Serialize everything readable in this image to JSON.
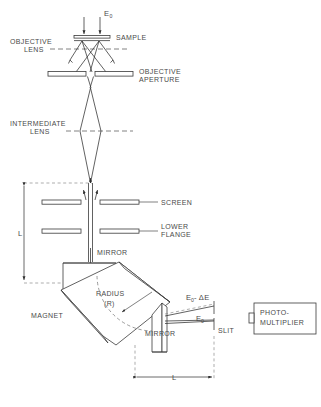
{
  "figure": {
    "caption": ""
  },
  "labels": {
    "beam_energy": "E",
    "beam_energy_sub": "0",
    "sample": "SAMPLE",
    "objective_lens_line1": "OBJECTIVE",
    "objective_lens_line2": "LENS",
    "objective_aperture_line1": "OBJECTIVE",
    "objective_aperture_line2": "APERTURE",
    "intermediate_lens_line1": "INTERMEDIATE",
    "intermediate_lens_line2": "LENS",
    "screen": "SCREEN",
    "lower_flange_line1": "LOWER",
    "lower_flange_line2": "FLANGE",
    "mirror_upper": "MIRROR",
    "mirror_lower": "MIRROR",
    "magnet": "MAGNET",
    "radius_line1": "RADIUS",
    "radius_line2": "(R)",
    "loss_beam": "E",
    "loss_beam_sub": "0",
    "loss_beam_delta": "- ΔE",
    "direct_beam": "E",
    "direct_beam_sub": "0",
    "slit": "SLIT",
    "photomultiplier_line1": "PHOTO-",
    "photomultiplier_line2": "MULTIPLIER",
    "dimension_vertical": "L",
    "dimension_horizontal": "L"
  },
  "colors": {
    "ink": "#3a3a3a",
    "text": "#4a4a4a",
    "dash": "#7a7a7a",
    "background": "#ffffff"
  }
}
